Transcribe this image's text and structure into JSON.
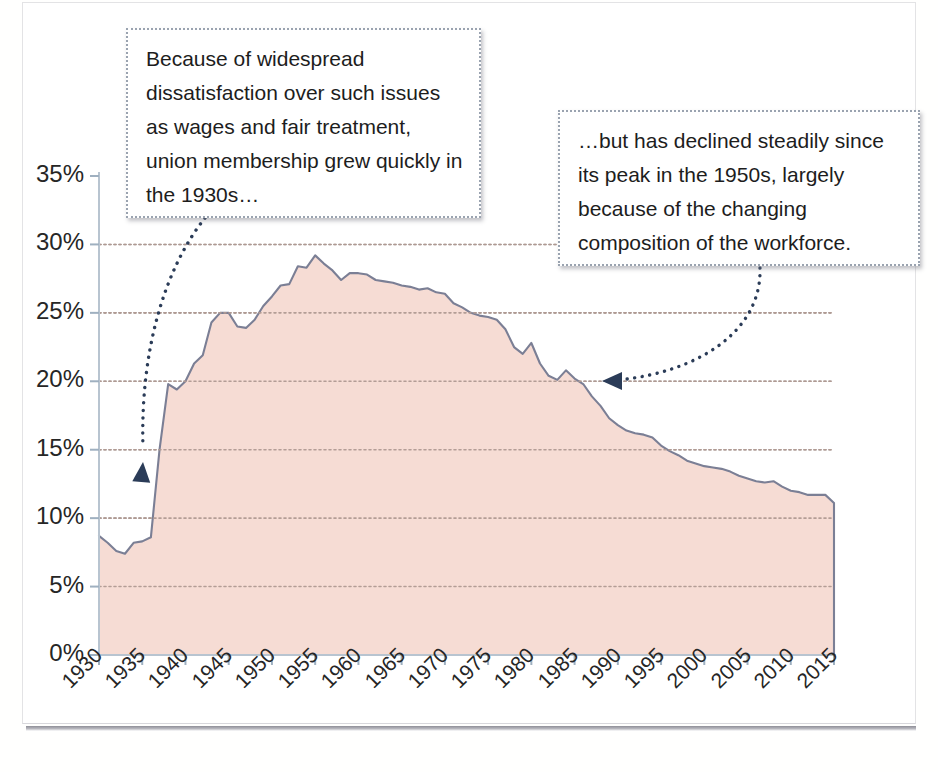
{
  "figure": {
    "background_color": "#ffffff",
    "frame_color": "#e3e3e5"
  },
  "annotations": [
    {
      "id": "callout-early-growth",
      "text": "Because of widespread dissatisfaction over such issues as wages and fair treatment, union membership grew quickly in the 1930s…",
      "arrow": "dotted-curved-arrow-pointing-down-left",
      "arrow_target_label": "1937 (~15%)"
    },
    {
      "id": "callout-decline",
      "text": "…but has declined steadily since its peak in the 1950s, largely because of the changing composition of the workforce.",
      "arrow": "dotted-curved-arrow-pointing-left",
      "arrow_target_label": "1990 (~16%)"
    }
  ],
  "chart_data": {
    "type": "area",
    "title": "",
    "subtitle": "",
    "xlabel": "",
    "ylabel": "",
    "xlim": [
      1930,
      2015
    ],
    "ylim": [
      0,
      35
    ],
    "grid": true,
    "grid_style": "dotted-horizontal",
    "legend": null,
    "legend_position": "none",
    "area_fill_color": "#f6dcd4",
    "line_color": "#7b7f95",
    "x_tick_labels": [
      "1930",
      "1935",
      "1940",
      "1945",
      "1950",
      "1955",
      "1960",
      "1965",
      "1970",
      "1975",
      "1980",
      "1985",
      "1990",
      "1995",
      "2000",
      "2005",
      "2010",
      "2015"
    ],
    "x_tick_values": [
      1930,
      1935,
      1940,
      1945,
      1950,
      1955,
      1960,
      1965,
      1970,
      1975,
      1980,
      1985,
      1990,
      1995,
      2000,
      2005,
      2010,
      2015
    ],
    "y_tick_labels": [
      "0%",
      "5%",
      "10%",
      "15%",
      "20%",
      "25%",
      "30%",
      "35%"
    ],
    "y_tick_values": [
      0,
      5,
      10,
      15,
      20,
      25,
      30,
      35
    ],
    "y_unit": "percent",
    "x": [
      1930,
      1931,
      1932,
      1933,
      1934,
      1935,
      1936,
      1937,
      1938,
      1939,
      1940,
      1941,
      1942,
      1943,
      1944,
      1945,
      1946,
      1947,
      1948,
      1949,
      1950,
      1951,
      1952,
      1953,
      1954,
      1955,
      1956,
      1957,
      1958,
      1959,
      1960,
      1961,
      1962,
      1963,
      1964,
      1965,
      1966,
      1967,
      1968,
      1969,
      1970,
      1971,
      1972,
      1973,
      1974,
      1975,
      1976,
      1977,
      1978,
      1979,
      1980,
      1981,
      1982,
      1983,
      1984,
      1985,
      1986,
      1987,
      1988,
      1989,
      1990,
      1991,
      1992,
      1993,
      1994,
      1995,
      1996,
      1997,
      1998,
      1999,
      2000,
      2001,
      2002,
      2003,
      2004,
      2005,
      2006,
      2007,
      2008,
      2009,
      2010,
      2011,
      2012,
      2013,
      2014,
      2015
    ],
    "values": [
      8.7,
      8.2,
      7.6,
      7.4,
      8.2,
      8.3,
      8.6,
      15.0,
      19.8,
      19.4,
      20.0,
      21.3,
      21.9,
      24.3,
      25.0,
      25.0,
      24.0,
      23.9,
      24.5,
      25.5,
      26.2,
      27.0,
      27.1,
      28.4,
      28.3,
      29.2,
      28.6,
      28.1,
      27.4,
      27.9,
      27.9,
      27.8,
      27.4,
      27.3,
      27.2,
      27.0,
      26.9,
      26.7,
      26.8,
      26.5,
      26.4,
      25.7,
      25.4,
      25.0,
      24.8,
      24.7,
      24.5,
      23.8,
      22.5,
      22.0,
      22.8,
      21.3,
      20.4,
      20.1,
      20.8,
      20.2,
      19.8,
      18.9,
      18.2,
      17.3,
      16.8,
      16.4,
      16.2,
      16.1,
      15.9,
      15.3,
      14.9,
      14.6,
      14.2,
      14.0,
      13.8,
      13.7,
      13.6,
      13.4,
      13.1,
      12.9,
      12.7,
      12.6,
      12.7,
      12.3,
      12.0,
      11.9,
      11.7,
      11.7,
      11.7,
      11.1
    ]
  }
}
